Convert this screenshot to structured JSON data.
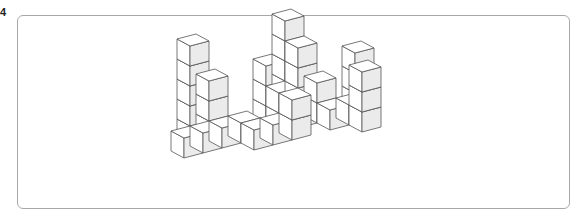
{
  "problem": {
    "number_label": "4"
  },
  "figure": {
    "colors": {
      "front_face": "#ffffff",
      "side_face": "#ebebeb",
      "top_face": "#ffffff",
      "edge": "#555555",
      "frame_border": "#a8a8a8"
    },
    "projection": {
      "origin": [
        184,
        158
      ],
      "u": [
        19,
        -5
      ],
      "v": [
        -13,
        -7
      ],
      "h": [
        0,
        -20
      ]
    },
    "cubes": [
      [
        0,
        0,
        0
      ],
      [
        1,
        0,
        0
      ],
      [
        1,
        1,
        0
      ],
      [
        1,
        1,
        1
      ],
      [
        1,
        1,
        2
      ],
      [
        1,
        1,
        3
      ],
      [
        1,
        1,
        4
      ],
      [
        2,
        1,
        0
      ],
      [
        2,
        1,
        1
      ],
      [
        2,
        1,
        2
      ],
      [
        2,
        0,
        0
      ],
      [
        3,
        0,
        0
      ],
      [
        3,
        -1,
        0
      ],
      [
        4,
        -1,
        0
      ],
      [
        5,
        -1,
        0
      ],
      [
        5,
        0,
        0
      ],
      [
        5,
        0,
        1
      ],
      [
        5,
        1,
        0
      ],
      [
        5,
        1,
        1
      ],
      [
        5,
        1,
        2
      ],
      [
        6,
        1,
        0
      ],
      [
        6,
        1,
        1
      ],
      [
        6,
        1,
        2
      ],
      [
        6,
        1,
        3
      ],
      [
        6,
        1,
        4
      ],
      [
        6,
        0,
        0
      ],
      [
        6,
        0,
        1
      ],
      [
        6,
        0,
        2
      ],
      [
        6,
        0,
        3
      ],
      [
        5,
        -1,
        1
      ],
      [
        7,
        0,
        0
      ],
      [
        7,
        0,
        1
      ],
      [
        7,
        -1,
        0
      ],
      [
        8,
        -1,
        0
      ],
      [
        9,
        0,
        0
      ],
      [
        9,
        0,
        1
      ],
      [
        9,
        0,
        2
      ],
      [
        8,
        -2,
        0
      ],
      [
        8,
        -2,
        1
      ],
      [
        8,
        -2,
        2
      ]
    ]
  }
}
